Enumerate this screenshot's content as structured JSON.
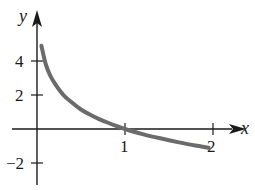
{
  "chart_data": {
    "type": "line",
    "title": "",
    "xlabel": "x",
    "ylabel": "y",
    "xlim": [
      0,
      2.1
    ],
    "ylim": [
      -2.5,
      5.5
    ],
    "x_ticks": [
      1,
      2
    ],
    "x_tick_labels": [
      "1",
      "2"
    ],
    "y_ticks": [
      -2,
      2,
      4
    ],
    "y_tick_labels": [
      "−2",
      "2",
      "4"
    ],
    "grid": false,
    "legend": null,
    "series": [
      {
        "name": "curve",
        "color": "#6b6b6b",
        "x": [
          0.05,
          0.1,
          0.15,
          0.2,
          0.3,
          0.4,
          0.5,
          0.6,
          0.7,
          0.8,
          0.9,
          1.0,
          1.2,
          1.4,
          1.6,
          1.8,
          1.95
        ],
        "y": [
          4.9,
          3.8,
          3.15,
          2.7,
          2.0,
          1.55,
          1.15,
          0.85,
          0.6,
          0.38,
          0.18,
          0.0,
          -0.3,
          -0.55,
          -0.77,
          -0.97,
          -1.1
        ]
      }
    ]
  },
  "labels": {
    "x_axis": "x",
    "y_axis": "y",
    "tick_x1": "1",
    "tick_x2": "2",
    "tick_y4": "4",
    "tick_y2": "2",
    "tick_yneg2": "−2"
  }
}
